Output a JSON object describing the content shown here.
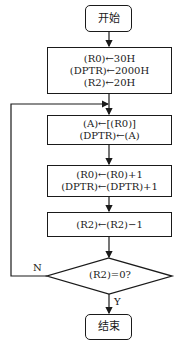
{
  "flowchart": {
    "start": "开始",
    "init": [
      "(R0)←30H",
      "(DPTR)←2000H",
      "(R2)←20H"
    ],
    "move": [
      "(A)←[(R0)]",
      "(DPTR)←(A)"
    ],
    "increment": [
      "(R0)←(R0)+1",
      "(DPTR)←(DPTR)+1"
    ],
    "decrement": "(R2)←(R2)−1",
    "decision": "(R2)=0?",
    "no_label": "N",
    "yes_label": "Y",
    "end": "结束"
  }
}
